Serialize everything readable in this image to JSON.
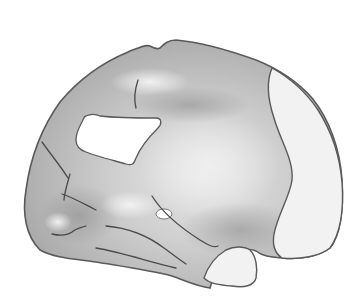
{
  "illustration": {
    "subject": "brain-hemisphere-lateral-view",
    "colors": {
      "background": "#ffffff",
      "body_base": "#c4c4c4",
      "body_light": "#e2e2e2",
      "body_dark": "#9e9e9e",
      "outline": "#5a5a5a",
      "highlight_region": "#f2f2f2",
      "cutout": "#ffffff"
    },
    "regions": [
      {
        "name": "cortex-body"
      },
      {
        "name": "frontal-window-cutout"
      },
      {
        "name": "occipital-light-region"
      },
      {
        "name": "cerebellar-light-lobe"
      },
      {
        "name": "small-oval-opening"
      }
    ]
  }
}
